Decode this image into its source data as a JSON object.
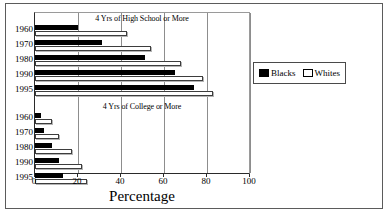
{
  "chart_data": {
    "type": "bar",
    "orientation": "horizontal",
    "title": "",
    "xlabel": "Percentage",
    "ylabel": "",
    "xlim": [
      0,
      100
    ],
    "xticks": [
      0,
      20,
      40,
      60,
      80,
      100
    ],
    "grid": true,
    "legend_position": "right",
    "legend": [
      "Blacks",
      "Whites"
    ],
    "groups": [
      {
        "name": "4 Yrs of High School or More",
        "categories": [
          "1960",
          "1970",
          "1980",
          "1990",
          "1995"
        ],
        "series": [
          {
            "name": "Blacks",
            "values": [
              20,
              31,
              51,
              65,
              74
            ]
          },
          {
            "name": "Whites",
            "values": [
              43,
              54,
              68,
              78,
              83
            ]
          }
        ]
      },
      {
        "name": "4 Yrs of College or More",
        "categories": [
          "1960",
          "1970",
          "1980",
          "1990",
          "1995"
        ],
        "series": [
          {
            "name": "Blacks",
            "values": [
              3,
              4,
              8,
              11,
              13
            ]
          },
          {
            "name": "Whites",
            "values": [
              8,
              11,
              17,
              22,
              24
            ]
          }
        ]
      }
    ]
  },
  "axis": {
    "tick_labels": [
      "0",
      "20",
      "40",
      "60",
      "80",
      "100"
    ],
    "title": "Percentage"
  },
  "groups": {
    "highschool": {
      "title": "4 Yrs of High School or More",
      "years": [
        "1960",
        "1970",
        "1980",
        "1990",
        "1995"
      ]
    },
    "college": {
      "title": "4 Yrs of College or More",
      "years": [
        "1960",
        "1970",
        "1980",
        "1990",
        "1995"
      ]
    }
  },
  "legend": {
    "blacks_label": "Blacks",
    "whites_label": "Whites"
  },
  "colors": {
    "blacks": "#000000",
    "whites": "#ffffff",
    "grid": "#8d8d8d",
    "axis": "#2a2a2a",
    "frame": "#5b5b5b"
  }
}
